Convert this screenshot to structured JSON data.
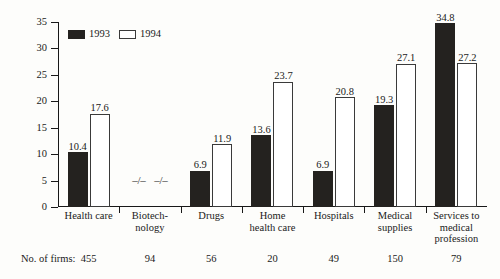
{
  "chart_data": {
    "type": "bar",
    "title": "",
    "subtitle": "",
    "xlabel": "",
    "ylabel": "",
    "ylim": [
      0,
      35
    ],
    "yticks": [
      0,
      5,
      10,
      15,
      20,
      25,
      30,
      35
    ],
    "grid": false,
    "legend_position": "top-left",
    "categories": [
      "Health care",
      "Biotechnology",
      "Drugs",
      "Home health care",
      "Hospitals",
      "Medical supplies",
      "Services to medical profession"
    ],
    "category_lines": [
      [
        "Health care"
      ],
      [
        "Biotech-",
        "nology"
      ],
      [
        "Drugs"
      ],
      [
        "Home",
        "health care"
      ],
      [
        "Hospitals"
      ],
      [
        "Medical",
        "supplies"
      ],
      [
        "Services to",
        "medical",
        "profession"
      ]
    ],
    "series": [
      {
        "name": "1993",
        "color": "#24221f",
        "style": "filled",
        "values": [
          10.4,
          null,
          6.9,
          13.6,
          6.9,
          19.3,
          34.8
        ],
        "labels": [
          "10.4",
          "–/–",
          "6.9",
          "13.6",
          "6.9",
          "19.3",
          "34.8"
        ]
      },
      {
        "name": "1994",
        "color": "#ffffff",
        "style": "hollow",
        "values": [
          17.6,
          null,
          11.9,
          23.7,
          20.8,
          27.1,
          27.2
        ],
        "labels": [
          "17.6",
          "–/–",
          "11.9",
          "23.7",
          "20.8",
          "27.1",
          "27.2"
        ]
      }
    ],
    "no_data_marker": "–/–",
    "footer": {
      "caption": "No. of firms:",
      "values": [
        "455",
        "94",
        "56",
        "20",
        "49",
        "150",
        "79"
      ]
    }
  }
}
